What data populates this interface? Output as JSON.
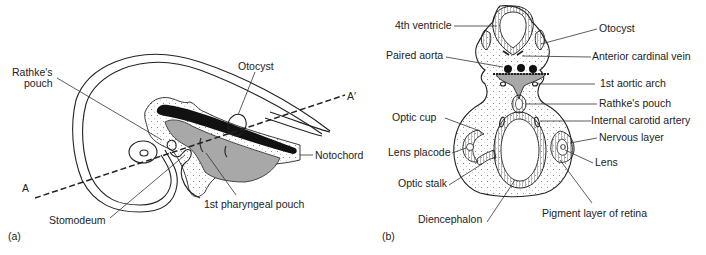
{
  "figure": {
    "panel_a": {
      "panel_label": "(a)",
      "labels": {
        "rathkes_pouch_line1": "Rathke's",
        "rathkes_pouch_line2": "pouch",
        "otocyst": "Otocyst",
        "a_prime": "A′",
        "notochord": "Notochord",
        "a": "A",
        "first_pharyngeal_pouch": "1st pharyngeal pouch",
        "stomodeum": "Stomodeum"
      }
    },
    "panel_b": {
      "panel_label": "(b)",
      "labels_left": {
        "fourth_ventricle": "4th ventricle",
        "paired_aorta": "Paired aorta",
        "optic_cup": "Optic cup",
        "lens_placode": "Lens placode",
        "optic_stalk": "Optic stalk",
        "diencephalon": "Diencephalon"
      },
      "labels_right": {
        "otocyst": "Otocyst",
        "anterior_cardinal_vein": "Anterior cardinal vein",
        "first_aortic_arch": "1st aortic arch",
        "rathkes_pouch": "Rathke's pouch",
        "internal_carotid_artery": "Internal carotid artery",
        "nervous_layer": "Nervous layer",
        "lens": "Lens",
        "pigment_layer_of_retina": "Pigment layer of retina"
      }
    },
    "colors": {
      "outline": "#222222",
      "shaded_region": "#a8a8a8",
      "notochord": "#111111",
      "background": "#ffffff"
    }
  }
}
